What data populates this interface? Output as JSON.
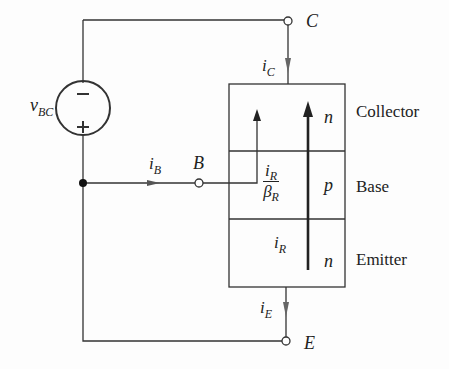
{
  "diagram": {
    "title": "",
    "colors": {
      "line": "#333333",
      "background": "#fdfdfd"
    },
    "source": {
      "label_main": "v",
      "label_sub": "BC",
      "minus": "−",
      "plus": "+"
    },
    "terminals": {
      "collector": "C",
      "base": "B",
      "emitter": "E"
    },
    "currents": {
      "ic_main": "i",
      "ic_sub": "C",
      "ib_main": "i",
      "ib_sub": "B",
      "ie_main": "i",
      "ie_sub": "E",
      "ir_main": "i",
      "ir_sub": "R",
      "frac_num_main": "i",
      "frac_num_sub": "R",
      "frac_den_main": "β",
      "frac_den_sub": "R"
    },
    "regions": [
      {
        "doping": "n",
        "name": "Collector"
      },
      {
        "doping": "p",
        "name": "Base"
      },
      {
        "doping": "n",
        "name": "Emitter"
      }
    ]
  }
}
